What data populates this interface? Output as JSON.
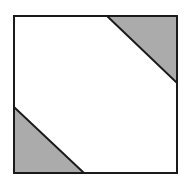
{
  "diagram": {
    "type": "geometric-figure",
    "colors": {
      "background": "#ffffff",
      "stroke": "#1a1a1a",
      "shade": "#ababab"
    },
    "square": {
      "x": 14,
      "y": 16,
      "width": 163,
      "height": 157
    },
    "shaded_triangles": [
      {
        "name": "top-right",
        "points": [
          [
            107,
            16
          ],
          [
            177,
            16
          ],
          [
            177,
            83
          ]
        ]
      },
      {
        "name": "bottom-left",
        "points": [
          [
            14,
            107
          ],
          [
            14,
            173
          ],
          [
            84,
            173
          ]
        ]
      }
    ]
  }
}
